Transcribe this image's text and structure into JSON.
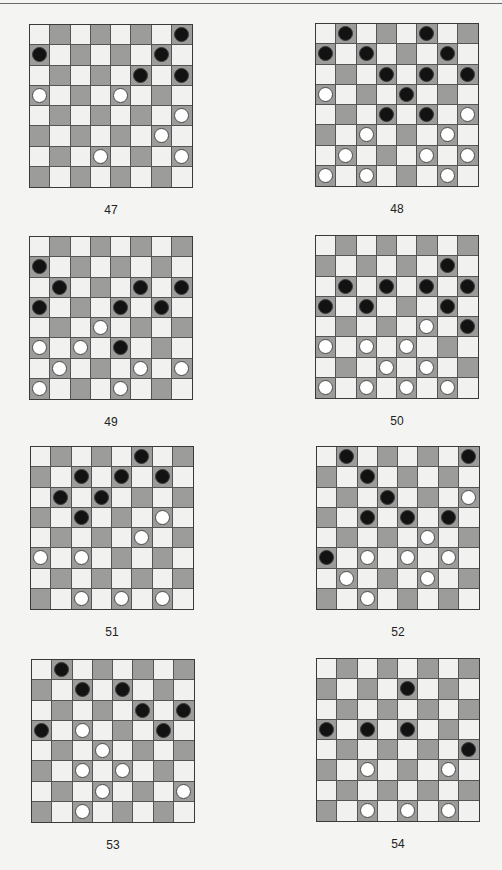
{
  "page": {
    "type": "checkers-puzzle-sheet"
  },
  "colors": {
    "light_square": "#f1f1ef",
    "dark_square": "#9c9c9a",
    "black_piece": "#121212",
    "white_piece": "#ffffff"
  },
  "puzzles": [
    {
      "number": "47",
      "black": [
        [
          0,
          7
        ],
        [
          1,
          0
        ],
        [
          1,
          6
        ],
        [
          2,
          5
        ],
        [
          2,
          7
        ]
      ],
      "white": [
        [
          3,
          0
        ],
        [
          3,
          4
        ],
        [
          4,
          7
        ],
        [
          5,
          6
        ],
        [
          6,
          3
        ],
        [
          6,
          7
        ]
      ]
    },
    {
      "number": "48",
      "black": [
        [
          0,
          1
        ],
        [
          0,
          5
        ],
        [
          1,
          0
        ],
        [
          1,
          2
        ],
        [
          1,
          6
        ],
        [
          2,
          3
        ],
        [
          2,
          5
        ],
        [
          2,
          7
        ],
        [
          3,
          4
        ],
        [
          4,
          3
        ],
        [
          4,
          5
        ]
      ],
      "white": [
        [
          3,
          0
        ],
        [
          4,
          7
        ],
        [
          5,
          2
        ],
        [
          5,
          6
        ],
        [
          6,
          1
        ],
        [
          6,
          5
        ],
        [
          6,
          7
        ],
        [
          7,
          0
        ],
        [
          7,
          2
        ],
        [
          7,
          6
        ]
      ]
    },
    {
      "number": "49",
      "black": [
        [
          1,
          0
        ],
        [
          2,
          1
        ],
        [
          2,
          5
        ],
        [
          2,
          7
        ],
        [
          3,
          0
        ],
        [
          3,
          4
        ],
        [
          3,
          6
        ],
        [
          5,
          4
        ]
      ],
      "white": [
        [
          4,
          3
        ],
        [
          5,
          0
        ],
        [
          5,
          2
        ],
        [
          6,
          1
        ],
        [
          6,
          5
        ],
        [
          6,
          7
        ],
        [
          7,
          0
        ],
        [
          7,
          4
        ]
      ]
    },
    {
      "number": "50",
      "black": [
        [
          1,
          6
        ],
        [
          2,
          1
        ],
        [
          2,
          3
        ],
        [
          2,
          5
        ],
        [
          2,
          7
        ],
        [
          3,
          0
        ],
        [
          3,
          2
        ],
        [
          3,
          6
        ],
        [
          4,
          7
        ]
      ],
      "white": [
        [
          4,
          5
        ],
        [
          5,
          0
        ],
        [
          5,
          2
        ],
        [
          5,
          4
        ],
        [
          6,
          3
        ],
        [
          6,
          5
        ],
        [
          7,
          0
        ],
        [
          7,
          2
        ],
        [
          7,
          4
        ],
        [
          7,
          6
        ]
      ]
    },
    {
      "number": "51",
      "black": [
        [
          0,
          5
        ],
        [
          1,
          2
        ],
        [
          1,
          4
        ],
        [
          1,
          6
        ],
        [
          2,
          1
        ],
        [
          2,
          3
        ],
        [
          3,
          2
        ]
      ],
      "white": [
        [
          3,
          6
        ],
        [
          4,
          5
        ],
        [
          5,
          0
        ],
        [
          5,
          2
        ],
        [
          7,
          2
        ],
        [
          7,
          4
        ],
        [
          7,
          6
        ]
      ]
    },
    {
      "number": "52",
      "black": [
        [
          0,
          1
        ],
        [
          0,
          7
        ],
        [
          1,
          2
        ],
        [
          2,
          3
        ],
        [
          3,
          2
        ],
        [
          3,
          4
        ],
        [
          3,
          6
        ],
        [
          5,
          0
        ]
      ],
      "white": [
        [
          2,
          7
        ],
        [
          4,
          5
        ],
        [
          5,
          2
        ],
        [
          5,
          4
        ],
        [
          5,
          6
        ],
        [
          6,
          1
        ],
        [
          6,
          5
        ],
        [
          7,
          2
        ]
      ]
    },
    {
      "number": "53",
      "black": [
        [
          0,
          1
        ],
        [
          1,
          2
        ],
        [
          1,
          4
        ],
        [
          2,
          5
        ],
        [
          2,
          7
        ],
        [
          3,
          0
        ],
        [
          3,
          6
        ]
      ],
      "white": [
        [
          3,
          2
        ],
        [
          4,
          3
        ],
        [
          5,
          2
        ],
        [
          5,
          4
        ],
        [
          6,
          3
        ],
        [
          6,
          7
        ],
        [
          7,
          2
        ]
      ]
    },
    {
      "number": "54",
      "black": [
        [
          1,
          4
        ],
        [
          3,
          0
        ],
        [
          3,
          2
        ],
        [
          3,
          4
        ],
        [
          4,
          7
        ]
      ],
      "white": [
        [
          5,
          2
        ],
        [
          5,
          6
        ],
        [
          7,
          2
        ],
        [
          7,
          4
        ],
        [
          7,
          6
        ]
      ]
    }
  ]
}
